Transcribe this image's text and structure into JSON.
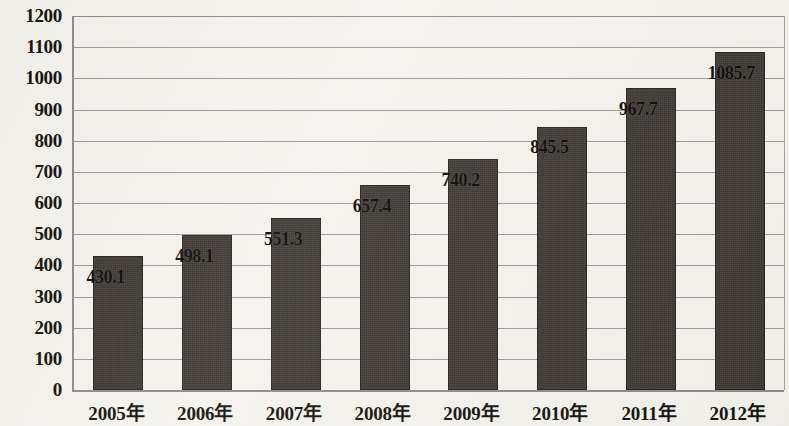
{
  "chart_data": {
    "type": "bar",
    "title": "",
    "xlabel": "",
    "ylabel": "",
    "categories": [
      "2005年",
      "2006年",
      "2007年",
      "2008年",
      "2009年",
      "2010年",
      "2011年",
      "2012年"
    ],
    "values": [
      430.1,
      498.1,
      551.3,
      657.4,
      740.2,
      845.5,
      967.7,
      1085.7
    ],
    "value_labels": [
      "430.1",
      "498.1",
      "551.3",
      "657.4",
      "740.2",
      "845.5",
      "967.7",
      "1085.7"
    ],
    "ylim": [
      0,
      1200
    ],
    "y_tick_step": 100,
    "y_ticks": [
      0,
      100,
      200,
      300,
      400,
      500,
      600,
      700,
      800,
      900,
      1000,
      1100,
      1200
    ],
    "y_tick_labels": [
      "0",
      "100",
      "200",
      "300",
      "400",
      "500",
      "600",
      "700",
      "800",
      "900",
      "1000",
      "1100",
      "1200"
    ],
    "grid": true,
    "legend": false,
    "legend_position": "none",
    "series": [
      {
        "name": "",
        "values": [
          430.1,
          498.1,
          551.3,
          657.4,
          740.2,
          845.5,
          967.7,
          1085.7
        ]
      }
    ],
    "colors": {
      "bar_fill": "#3c3732",
      "bar_border": "#2b2723",
      "gridline": "#9a9a97",
      "axis": "#8d8d8a",
      "text": "#17150f",
      "background": "#f4f2ed"
    }
  }
}
